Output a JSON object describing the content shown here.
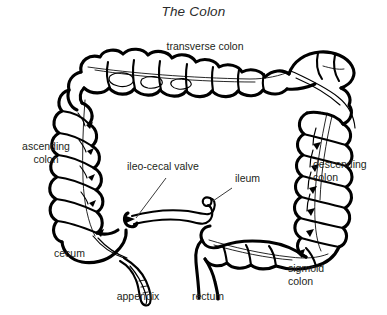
{
  "figure": {
    "title": "The Colon",
    "background_color": "#ffffff",
    "ink_color": "#000000",
    "label_color": "#231f20",
    "labels": [
      {
        "id": "transverse-colon",
        "text": "transverse colon"
      },
      {
        "id": "ascending-colon",
        "text": "ascending\ncolon"
      },
      {
        "id": "descending-colon",
        "text": "descending\ncolon"
      },
      {
        "id": "ileo-cecal-valve",
        "text": "ileo-cecal valve"
      },
      {
        "id": "ileum",
        "text": "ileum"
      },
      {
        "id": "cecum",
        "text": "cecum"
      },
      {
        "id": "appendix",
        "text": "appendix"
      },
      {
        "id": "rectum",
        "text": "rectum"
      },
      {
        "id": "sigmoid-colon",
        "text": "sigmoid\ncolon"
      }
    ]
  }
}
